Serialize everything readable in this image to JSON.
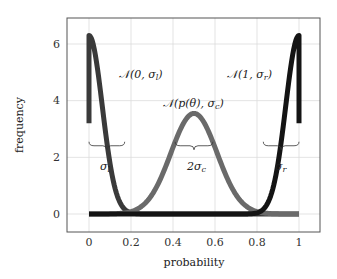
{
  "chart_data": {
    "type": "line",
    "title": "",
    "xlabel": "probability",
    "ylabel": "frequency",
    "xlim": [
      -0.1,
      1.1
    ],
    "ylim": [
      -0.7,
      7.0
    ],
    "xticks": [
      0,
      0.2,
      0.4,
      0.6,
      0.8,
      1
    ],
    "xtick_labels": [
      "0",
      "0.2",
      "0.4",
      "0.6",
      "0.8",
      "1"
    ],
    "yticks": [
      0,
      2,
      4,
      6
    ],
    "ytick_labels": [
      "0",
      "2",
      "4",
      "6"
    ],
    "grid": true,
    "legend": "none",
    "series": [
      {
        "name": "N(0, σ_l)",
        "label": "𝒩(0, σ_l)",
        "kind": "half-gaussian",
        "mean": 0.0,
        "sigma": 0.063,
        "peak": 6.3,
        "x_range": [
          0,
          1
        ],
        "color": "#3a3a3a",
        "starts_at_y": 3.2
      },
      {
        "name": "N(p(θ), σ_c)",
        "label": "𝒩(p(θ), σ_c)",
        "kind": "gaussian",
        "mean": 0.5,
        "sigma": 0.11,
        "peak": 3.55,
        "x_range": [
          0,
          1
        ],
        "color": "#6a6a6a"
      },
      {
        "name": "N(1, σ_r)",
        "label": "𝒩(1, σ_r)",
        "kind": "half-gaussian",
        "mean": 1.0,
        "sigma": 0.063,
        "peak": 6.3,
        "x_range": [
          0,
          1
        ],
        "color": "#141414",
        "ends_at_y": 3.2
      }
    ],
    "annotations": [
      {
        "text": "σ_l",
        "x": 0.085,
        "y": 1.6,
        "brace": [
          0.0,
          0.17,
          2.55
        ]
      },
      {
        "text": "2σ_c",
        "x": 0.5,
        "y": 1.6,
        "brace": [
          0.41,
          0.59,
          2.55
        ]
      },
      {
        "text": "σ_r",
        "x": 0.915,
        "y": 1.6,
        "brace": [
          0.83,
          1.0,
          2.55
        ]
      }
    ]
  },
  "labels": {
    "xlabel": "probability",
    "ylabel": "frequency",
    "left_curve": "𝒩(0, σ",
    "left_curve_sub": "l",
    "center_curve_a": "𝒩(p(θ), σ",
    "center_curve_sub": "c",
    "right_curve": "𝒩(1, σ",
    "right_curve_sub": "r",
    "close_paren": ")",
    "sigma": "σ",
    "sub_l": "l",
    "sub_r": "r",
    "two_sigma": "2σ",
    "sub_c": "c",
    "xticks": [
      "0",
      "0.2",
      "0.4",
      "0.6",
      "0.8",
      "1"
    ],
    "yticks": [
      "0",
      "2",
      "4",
      "6"
    ]
  }
}
